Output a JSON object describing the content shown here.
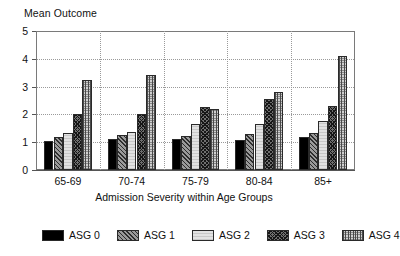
{
  "chart_data": {
    "type": "bar",
    "title": "Mean Outcome",
    "xlabel": "Admission Severity within Age Groups",
    "ylabel": "Mean Outcome",
    "ylim": [
      0,
      5
    ],
    "yticks": [
      0,
      1,
      2,
      3,
      4,
      5
    ],
    "ytick_labels": [
      "0",
      "1",
      "2",
      "3",
      "4",
      "5"
    ],
    "grid": "horizontal dotted gridlines at 1,2,3,4 plus vertical dotted group separators",
    "legend_position": "bottom",
    "categories": [
      "65-69",
      "70-74",
      "75-79",
      "80-84",
      "85+"
    ],
    "series": [
      {
        "name": "ASG 0",
        "pattern": "solid-black",
        "values": [
          1.06,
          1.12,
          1.1,
          1.09,
          1.18
        ]
      },
      {
        "name": "ASG 1",
        "pattern": "diagonal-hatch-dark",
        "values": [
          1.19,
          1.27,
          1.24,
          1.3,
          1.34
        ]
      },
      {
        "name": "ASG 2",
        "pattern": "light-fine-grid",
        "values": [
          1.34,
          1.36,
          1.65,
          1.66,
          1.78
        ]
      },
      {
        "name": "ASG 3",
        "pattern": "crosshatch-dark",
        "values": [
          2.03,
          2.02,
          2.26,
          2.57,
          2.31
        ]
      },
      {
        "name": "ASG 4",
        "pattern": "vertical-grid-light",
        "values": [
          3.24,
          3.42,
          2.19,
          2.8,
          4.09
        ]
      }
    ]
  },
  "legend": {
    "items": [
      {
        "label": "ASG 0"
      },
      {
        "label": "ASG 1"
      },
      {
        "label": "ASG 2"
      },
      {
        "label": "ASG 3"
      },
      {
        "label": "ASG 4"
      }
    ]
  },
  "colors": {
    "axis": "#555555",
    "frame": "#7a7a7a",
    "grid": "#9a9a9a",
    "bar_outline": "#2a2a2a",
    "asg0": "#000000",
    "asg1": "#9a9a9a",
    "asg2": "#e2e2e2",
    "asg3": "#6f6f6f",
    "asg4": "#d0d0d0"
  }
}
